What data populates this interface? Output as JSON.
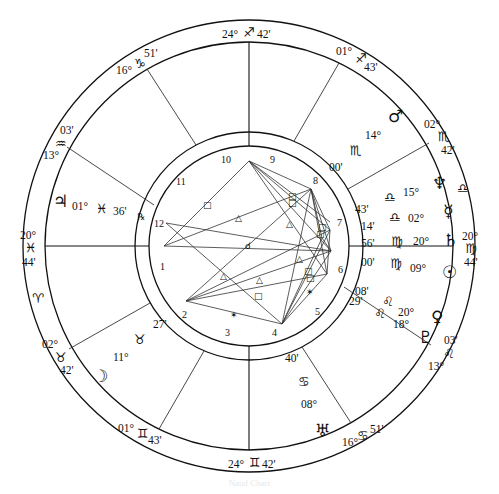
{
  "chart": {
    "type": "natal-chart-wheel",
    "angles": {
      "ascendant": {
        "deg": "20°",
        "sign_glyph": "♓",
        "min": "44'"
      },
      "descendant": {
        "deg": "20°",
        "sign_glyph": "♍",
        "min": "44'"
      },
      "midheaven": {
        "deg": "24°",
        "sign_glyph": "♐",
        "min": "42'"
      },
      "imum_coeli": {
        "deg": "24°",
        "sign_glyph": "♊",
        "min": "42'"
      }
    },
    "house_cusps": [
      {
        "house": "11",
        "deg": "16°",
        "sign_glyph": "♑",
        "min": "51'"
      },
      {
        "house": "12",
        "deg": "13°",
        "sign_glyph": "♒",
        "min": "03'"
      },
      {
        "house": "2",
        "deg": "02°",
        "sign_glyph": "♉",
        "min": "42'"
      },
      {
        "house": "3",
        "deg": "01°",
        "sign_glyph": "♊",
        "min": "43'"
      },
      {
        "house": "5",
        "deg": "16°",
        "sign_glyph": "♋",
        "min": "51'"
      },
      {
        "house": "6",
        "deg": "13°",
        "sign_glyph": "♌",
        "min": "03'"
      },
      {
        "house": "8",
        "deg": "02°",
        "sign_glyph": "♏",
        "min": "42'"
      },
      {
        "house": "9",
        "deg": "01°",
        "sign_glyph": "♐",
        "min": "43'"
      }
    ],
    "intercepted_signs": [
      {
        "glyph": "♈",
        "position": "left"
      },
      {
        "glyph": "♎",
        "position": "right"
      }
    ],
    "house_numbers": [
      "1",
      "2",
      "3",
      "4",
      "5",
      "6",
      "7",
      "8",
      "9",
      "10",
      "11",
      "12"
    ],
    "planets": [
      {
        "name": "Jupiter",
        "glyph": "♃",
        "deg": "01°",
        "sign_glyph": "♓",
        "min": "36'",
        "retrograde": "℞"
      },
      {
        "name": "Mars",
        "glyph": "♂",
        "deg": "14°",
        "sign_glyph": "♏",
        "min": "00'"
      },
      {
        "name": "Neptune",
        "glyph": "♆",
        "deg": "15°",
        "sign_glyph": "♎",
        "min": "43'"
      },
      {
        "name": "Mercury",
        "glyph": "☿",
        "deg": "02°",
        "sign_glyph": "♎",
        "min": "14'"
      },
      {
        "name": "Saturn",
        "glyph": "♄",
        "deg": "20°",
        "sign_glyph": "♍",
        "min": "56'"
      },
      {
        "name": "Sun",
        "glyph": "☉",
        "deg": "09°",
        "sign_glyph": "♍",
        "min": "00'"
      },
      {
        "name": "Venus",
        "glyph": "♀",
        "deg": "20°",
        "sign_glyph": "♌",
        "min": "08'"
      },
      {
        "name": "Pluto",
        "glyph": "♇",
        "deg": "18°",
        "sign_glyph": "♌",
        "min": "29'"
      },
      {
        "name": "Uranus",
        "glyph": "♅",
        "deg": "08°",
        "sign_glyph": "♋",
        "min": "40'"
      },
      {
        "name": "Moon",
        "glyph": "☽",
        "deg": "11°",
        "sign_glyph": "♉",
        "min": "27'"
      }
    ],
    "aspect_symbols": {
      "square": "□",
      "trine": "△",
      "sextile": "✶",
      "conjunction": "☌"
    },
    "caption": "Natal Chart"
  }
}
